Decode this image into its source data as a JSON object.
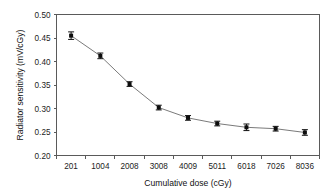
{
  "chart_data": {
    "type": "line",
    "title": "",
    "xlabel": "Cumulative dose (cGy)",
    "ylabel": "Radiator sensitivity (mV/cGy)",
    "categories": [
      "201",
      "1004",
      "2008",
      "3008",
      "4009",
      "5011",
      "6018",
      "7026",
      "8036"
    ],
    "values": [
      0.455,
      0.412,
      0.352,
      0.302,
      0.28,
      0.268,
      0.26,
      0.257,
      0.249
    ],
    "errors": [
      0.008,
      0.006,
      0.005,
      0.005,
      0.005,
      0.005,
      0.007,
      0.005,
      0.006
    ],
    "ylim": [
      0.2,
      0.5
    ],
    "yticks": [
      "0.20",
      "0.25",
      "0.30",
      "0.35",
      "0.40",
      "0.45",
      "0.50"
    ],
    "ytick_values": [
      0.2,
      0.25,
      0.3,
      0.35,
      0.4,
      0.45,
      0.5
    ],
    "grid": false,
    "legend": false,
    "marker": "square",
    "error_bars": true,
    "line_color": "#6b6b6b",
    "marker_color": "#0d0d0d"
  },
  "axes": {
    "y_axis_label": "Radiator sensitivity (mV/cGy)",
    "x_axis_label": "Cumulative dose (cGy)"
  }
}
